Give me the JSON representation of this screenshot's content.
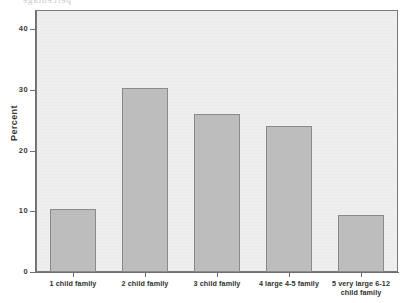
{
  "chart_data": {
    "type": "bar",
    "title": "",
    "xlabel": "",
    "ylabel": "Percent",
    "ylim": [
      0,
      43
    ],
    "yticks": [
      40,
      30,
      20,
      10,
      0
    ],
    "grid": false,
    "legend": "none",
    "categories": [
      "1 child family",
      "2 child family",
      "3 child family",
      "4 large 4-5 family",
      "5 very large 6-12 child family"
    ],
    "values": [
      10.4,
      30.3,
      26.1,
      24.0,
      9.4
    ],
    "bar_color": "#bdbdbd",
    "bar_edge_color": "#8a8a8a",
    "plot_background": "#efefef",
    "axis_color": "#6f6f6f"
  },
  "axis": {
    "y_title": "Percent",
    "y_tick_labels": [
      "40",
      "30",
      "20",
      "10",
      "0"
    ],
    "x_tick_labels": [
      {
        "line1": "1 child family",
        "line2": ""
      },
      {
        "line1": "2 child family",
        "line2": ""
      },
      {
        "line1": "3 child family",
        "line2": ""
      },
      {
        "line1": "4 large 4-5 family",
        "line2": ""
      },
      {
        "line1": "5 very large 6-12",
        "line2": "child family"
      }
    ]
  },
  "artifacts": {
    "bleed_line_1": "Don't Look At Me",
    "bleed_line_2": "My Family Is Not Crazy",
    "bleed_top": "percentage"
  }
}
